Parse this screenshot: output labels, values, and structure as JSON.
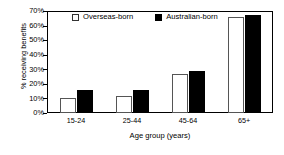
{
  "chart_data": {
    "type": "bar",
    "title": "",
    "xlabel": "Age group (years)",
    "ylabel": "% receiving benefits",
    "categories": [
      "15-24",
      "25-44",
      "45-64",
      "65+"
    ],
    "series": [
      {
        "name": "Overseas-born",
        "values": [
          10,
          12,
          27,
          66
        ],
        "color": "#ffffff"
      },
      {
        "name": "Australian-born",
        "values": [
          16,
          16,
          29,
          67
        ],
        "color": "#000000"
      }
    ],
    "ylim": [
      0,
      70
    ],
    "ytick_labels": [
      "0%",
      "10%",
      "20%",
      "30%",
      "40%",
      "50%",
      "60%",
      "70%"
    ],
    "ytick_values": [
      0,
      10,
      20,
      30,
      40,
      50,
      60,
      70
    ],
    "grid": false,
    "legend_position": "top-left-inside",
    "legend_entries": [
      "Overseas-born",
      "Australian-born"
    ]
  }
}
